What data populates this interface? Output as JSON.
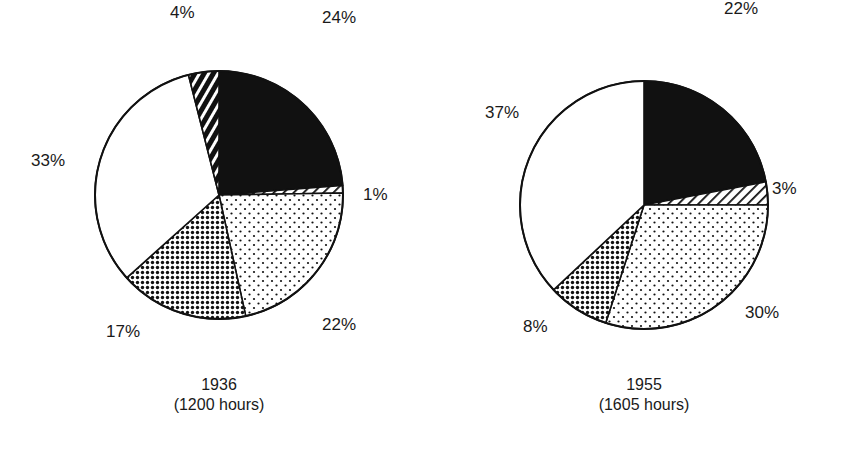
{
  "chart_data": [
    {
      "type": "pie",
      "title": "1936",
      "subtitle": "(1200 hours)",
      "start_angle_deg": 0,
      "direction": "clockwise",
      "slices": [
        {
          "label": "24%",
          "value": 24,
          "pattern": "solid-black"
        },
        {
          "label": "1%",
          "value": 1,
          "pattern": "thin-diagonal-hatch"
        },
        {
          "label": "22%",
          "value": 22,
          "pattern": "sparse-dots"
        },
        {
          "label": "17%",
          "value": 17,
          "pattern": "dense-dots"
        },
        {
          "label": "33%",
          "value": 33,
          "pattern": "white"
        },
        {
          "label": "4%",
          "value": 4,
          "pattern": "bold-diagonal-hatch"
        }
      ],
      "center": [
        219,
        195
      ],
      "radius": 124,
      "label_positions": [
        [
          322,
          9
        ],
        [
          363,
          186
        ],
        [
          322,
          316
        ],
        [
          106,
          323
        ],
        [
          31,
          152
        ],
        [
          170,
          4
        ]
      ]
    },
    {
      "type": "pie",
      "title": "1955",
      "subtitle": "(1605 hours)",
      "start_angle_deg": 0,
      "direction": "clockwise",
      "slices": [
        {
          "label": "22%",
          "value": 22,
          "pattern": "solid-black"
        },
        {
          "label": "3%",
          "value": 3,
          "pattern": "thin-diagonal-hatch"
        },
        {
          "label": "30%",
          "value": 30,
          "pattern": "sparse-dots"
        },
        {
          "label": "8%",
          "value": 8,
          "pattern": "dense-dots"
        },
        {
          "label": "37%",
          "value": 37,
          "pattern": "white"
        }
      ],
      "center": [
        644,
        205
      ],
      "radius": 124,
      "label_positions": [
        [
          724,
          0
        ],
        [
          772,
          180
        ],
        [
          745,
          304
        ],
        [
          523,
          318
        ],
        [
          485,
          104
        ]
      ]
    }
  ]
}
